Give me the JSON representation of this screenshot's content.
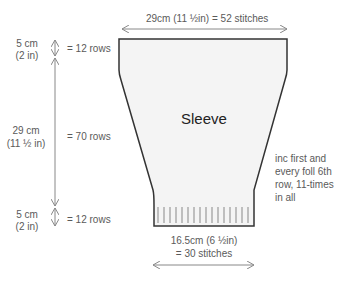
{
  "diagram": {
    "piece_label": "Sleeve",
    "top_width": {
      "text": "29cm (11 ½in) = 52 stitches"
    },
    "bottom_width": {
      "line1": "16.5cm (6 ½in)",
      "line2": "= 30 stitches"
    },
    "height_segments": [
      {
        "cm": "5 cm",
        "in": "(2 in)",
        "rows": "= 12 rows"
      },
      {
        "cm": "29 cm",
        "in": "(11 ½ in)",
        "rows": "= 70 rows"
      },
      {
        "cm": "5 cm",
        "in": "(2 in)",
        "rows": "= 12 rows"
      }
    ],
    "shaping_note": {
      "line1": "inc first and",
      "line2": "every foll 6th",
      "line3": "row, 11-times",
      "line4": "in all"
    },
    "colors": {
      "outline": "#333333",
      "fill": "#f4f4f4",
      "dimension_line": "#888888",
      "text": "#5a5a5a"
    }
  }
}
